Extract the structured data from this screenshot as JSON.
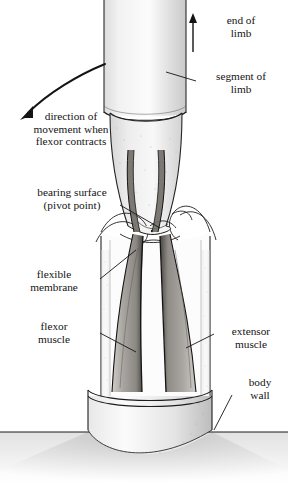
{
  "figure": {
    "background_color": "#ffffff",
    "ink_color": "#141414",
    "muscle_fill_color": "#9a9a9a",
    "stipple_color": "#b8b8b8",
    "labels": {
      "end_of_limb": "end of\nlimb",
      "segment_of_limb": "segment of\nlimb",
      "direction_of_movement": "direction of\nmovement when\nflexor contracts",
      "bearing_surface": "bearing surface\n(pivot point)",
      "flexible_membrane": "flexible\nmembrane",
      "flexor_muscle": "flexor\nmuscle",
      "extensor_muscle": "extensor\nmuscle",
      "body_wall": "body\nwall"
    },
    "icons": {
      "up_arrow": "end-of-limb-arrow",
      "curved_arrow": "direction-of-movement-arrow"
    }
  }
}
